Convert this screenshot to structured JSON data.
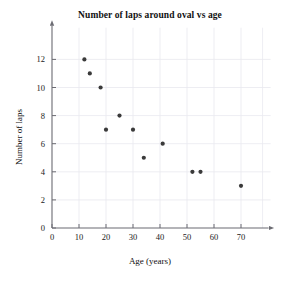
{
  "chart_data": {
    "type": "scatter",
    "title": "Number of laps around oval vs age",
    "xlabel": "Age (years)",
    "ylabel": "Number of laps",
    "xlim": [
      0,
      78
    ],
    "ylim": [
      0,
      13.4
    ],
    "xticks": [
      0,
      10,
      20,
      30,
      40,
      50,
      60,
      70
    ],
    "yticks": [
      0,
      2,
      4,
      6,
      8,
      10,
      12
    ],
    "xtick_labels": [
      "0",
      "10",
      "20",
      "30",
      "40",
      "50",
      "60",
      "70"
    ],
    "ytick_labels": [
      "0",
      "2",
      "4",
      "6",
      "8",
      "10",
      "12"
    ],
    "grid": true,
    "legend": null,
    "marker": "circle",
    "marker_color": "#3a3a3a",
    "points": [
      {
        "x": 12,
        "y": 12
      },
      {
        "x": 14,
        "y": 11
      },
      {
        "x": 18,
        "y": 10
      },
      {
        "x": 20,
        "y": 7
      },
      {
        "x": 25,
        "y": 8
      },
      {
        "x": 30,
        "y": 7
      },
      {
        "x": 34,
        "y": 5
      },
      {
        "x": 41,
        "y": 6
      },
      {
        "x": 52,
        "y": 4
      },
      {
        "x": 55,
        "y": 4
      },
      {
        "x": 70,
        "y": 3
      }
    ]
  }
}
